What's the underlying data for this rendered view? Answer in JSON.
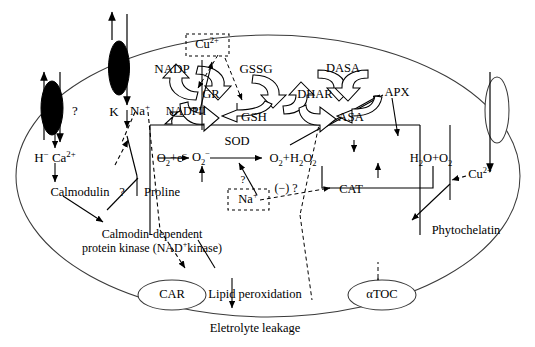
{
  "diagram": {
    "membrane": {
      "name": "cell-membrane-outline",
      "color": "#3a3a3a"
    }
  },
  "channels": [
    {
      "name": "channel-left-filled",
      "style": "filled-oval",
      "query": "?"
    },
    {
      "name": "channel-na-filled",
      "style": "filled-oval"
    },
    {
      "name": "channel-right-open",
      "style": "open-oval"
    }
  ],
  "labels": {
    "query_left": "?",
    "k": "K",
    "na_plus": "Na",
    "na_plus_sup": "+",
    "nadpii": "NADPII",
    "h_ca": "H",
    "h_sup": "−",
    "ca": "Ca",
    "ca_sup": "2+",
    "calmodulin": "Calmodulin",
    "query_mid": "?",
    "proline": "Proline",
    "kinase_line1": "Calmodin-dependent",
    "kinase_line2a": "protein kinase (NAD",
    "kinase_sup": "+",
    "kinase_line2b": "kinase)",
    "cu_box": "Cu",
    "cu_box_sup": "2+",
    "nadp": "NADP",
    "gssg": "GSSG",
    "gr": "GR",
    "gsh": "GSH",
    "dhar": "DHAR",
    "dasa": "DASA",
    "asa": "ASA",
    "apx": "APX",
    "o2_e": "O",
    "o2_e_sub": "2",
    "o2_e_rest": "+e",
    "o2_e_sup": "−",
    "superoxide": "O",
    "superoxide_sub": "2",
    "superoxide_sup": "−",
    "sod": "SOD",
    "o2h2o2_a": "O",
    "o2h2o2_a_sub": "2",
    "o2h2o2_b": "+H",
    "o2h2o2_b_sub": "2",
    "o2h2o2_c": "O",
    "o2h2o2_c_sub": "2",
    "h2o_o2_a": "H",
    "h2o_o2_a_sub": "2",
    "h2o_o2_b": "O+O",
    "h2o_o2_b_sub": "2",
    "na_box": "Na",
    "na_box_sup": "+",
    "na_query": "?",
    "neg_query": "(−) ?",
    "cat": "CAT",
    "cu_right": "Cu",
    "cu_right_sup": "2+",
    "phytochelatin": "Phytochelatin",
    "car": "CAR",
    "lipid_perox": "Lipid peroxidation",
    "electrolyte": "Eletrolyte leakage",
    "atoc": "αTOC"
  }
}
